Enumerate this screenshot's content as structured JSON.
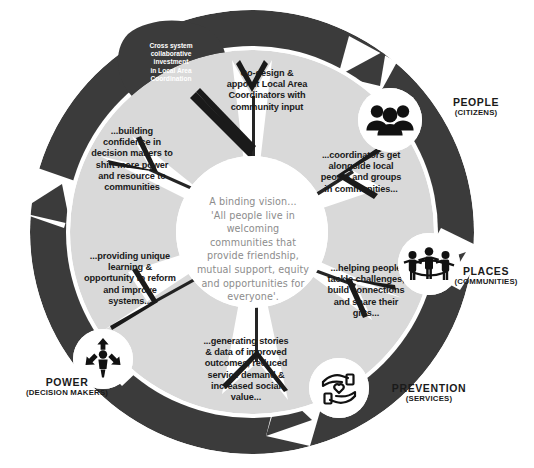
{
  "diagram": {
    "colors": {
      "ring_dark": "#3b3b3b",
      "segment_light": "#d9d9d9",
      "center_white": "#ffffff",
      "text_dark": "#1a1a1a",
      "text_light": "#8c8c8c",
      "badge_white": "#ffffff",
      "background": "#ffffff"
    },
    "center": {
      "text": "A binding vision...\n'All people live in\nwelcoming\ncommunities that\nprovide friendship,\nmutual support, equity\nand opportunities for\neveryone'."
    },
    "ring_label": {
      "text": "Cross system\ncollaborative\ninvestment\nin Local Area\nCoordination"
    },
    "segments": [
      {
        "id": "co-design",
        "text": "Co-design &\nappoint Local Area\nCoordinators with\ncommunity input"
      },
      {
        "id": "coordinators",
        "text": "...coordinators get\nalongside local\npeople and groups\nin communities..."
      },
      {
        "id": "helping-people",
        "text": "...helping people\ntackle challenges,\nbuild connections\nand share their\ngifts..."
      },
      {
        "id": "generating-stories",
        "text": "...generating stories\n& data of improved\noutcomes, reduced\nservice demand &\nincreased social\nvalue..."
      },
      {
        "id": "providing-learning",
        "text": "...providing unique\nlearning &\nopportunity to reform\nand improve\nsystems..."
      },
      {
        "id": "building-confidence",
        "text": "...building\nconfidence in\ndecision makers to\nshift more power\nand resource to\ncommunities"
      }
    ],
    "pillars": [
      {
        "id": "people",
        "title": "PEOPLE",
        "subtitle": "(CITIZENS)",
        "icon": "group-of-people-icon"
      },
      {
        "id": "places",
        "title": "PLACES",
        "subtitle": "(COMMUNITIES)",
        "icon": "people-holding-hands-circle-icon"
      },
      {
        "id": "prevention",
        "title": "PREVENTION",
        "subtitle": "(SERVICES)",
        "icon": "hands-holding-heart-icon"
      },
      {
        "id": "power",
        "title": "POWER",
        "subtitle": "(DECISION MAKERS)",
        "icon": "person-with-arrows-icon"
      }
    ]
  }
}
